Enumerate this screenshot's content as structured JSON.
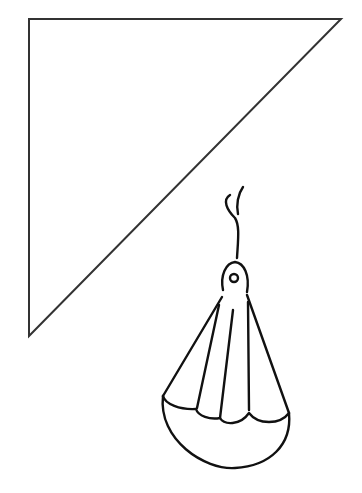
{
  "drawing": {
    "description": "Line drawing of a right triangle and a hanging shuttlecock-shaped object",
    "stroke_color": "#222222",
    "background": "#ffffff",
    "shapes": [
      "right-triangle",
      "hanging-shuttlecock"
    ]
  }
}
